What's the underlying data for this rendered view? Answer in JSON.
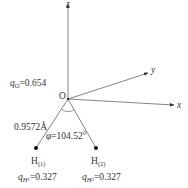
{
  "diagram": {
    "axes": {
      "x": {
        "label": "x"
      },
      "y": {
        "label": "y"
      },
      "z": {
        "label": "z"
      }
    },
    "origin": {
      "label": "O"
    },
    "atoms": [
      {
        "id": "H1",
        "label_main": "H",
        "label_sub": "(1)",
        "charge_symbol": "q",
        "charge_sub": "H",
        "charge_subsub": "1",
        "charge_value": "=0.327"
      },
      {
        "id": "H2",
        "label_main": "H",
        "label_sub": "(2)",
        "charge_symbol": "q",
        "charge_sub": "H",
        "charge_subsub": "2",
        "charge_value": "=0.327"
      }
    ],
    "oxygen_charge": {
      "symbol": "q",
      "sub": "O",
      "value": "=0.654"
    },
    "bond_length": "0.9572Å",
    "bond_angle": {
      "symbol": "φ",
      "value": "=104.52°"
    },
    "colors": {
      "line": "#6e6e6e",
      "text": "#333333",
      "atom": "#111111"
    }
  }
}
